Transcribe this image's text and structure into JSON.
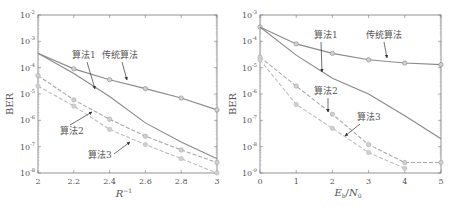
{
  "colors": {
    "axis": "#777777",
    "traditional": "#8a8a8a",
    "alg1": "#8a8a8a",
    "alg2": "#a8a8a8",
    "alg3": "#bdbdbd",
    "text": "#555555"
  },
  "chart_data": [
    {
      "type": "line",
      "title": "",
      "xlabel": "R^-1",
      "ylabel": "BER",
      "yscale": "log",
      "xlim": [
        2,
        3
      ],
      "ylim": [
        1e-08,
        0.01
      ],
      "grid": false,
      "xticks": [
        "2",
        "2.2",
        "2.4",
        "2.6",
        "2.8",
        "3"
      ],
      "yticks": [
        "10^-8",
        "10^-7",
        "10^-6",
        "10^-5",
        "10^-4",
        "10^-3",
        "10^-2"
      ],
      "x": [
        2,
        2.2,
        2.4,
        2.6,
        2.8,
        3
      ],
      "series": [
        {
          "name": "传统算法",
          "style": "solid",
          "marker": "circle",
          "values": [
            0.00035,
            9e-05,
            3.5e-05,
            1.6e-05,
            7e-06,
            2.5e-06
          ]
        },
        {
          "name": "算法1",
          "style": "solid",
          "marker": "none",
          "values": [
            0.00035,
            6e-05,
            8e-06,
            8e-07,
            1.5e-07,
            3.5e-08
          ]
        },
        {
          "name": "算法2",
          "style": "dashed",
          "marker": "circle",
          "values": [
            5e-05,
            6e-06,
            1.1e-06,
            2.5e-07,
            7.5e-08,
            2.5e-08
          ]
        },
        {
          "name": "算法3",
          "style": "dashed",
          "marker": "circle",
          "values": [
            2e-05,
            3.5e-06,
            4.5e-07,
            1.2e-07,
            3.5e-08,
            1e-08
          ]
        }
      ],
      "annotations": [
        {
          "text": "算法1",
          "x": 2.2,
          "y": 0.0004
        },
        {
          "text": "传统算法",
          "x": 2.36,
          "y": 0.0004
        },
        {
          "text": "算法2",
          "x": 2.12,
          "y": 4e-07
        },
        {
          "text": "算法3",
          "x": 2.3,
          "y": 6e-08
        }
      ]
    },
    {
      "type": "line",
      "title": "",
      "xlabel": "E_b/N_0",
      "ylabel": "BER",
      "yscale": "log",
      "xlim": [
        0,
        5
      ],
      "ylim": [
        1e-09,
        0.001
      ],
      "grid": false,
      "xticks": [
        "0",
        "1",
        "2",
        "3",
        "4",
        "5"
      ],
      "yticks": [
        "10^-9",
        "10^-8",
        "10^-7",
        "10^-6",
        "10^-5",
        "10^-4",
        "10^-3"
      ],
      "x": [
        0,
        1,
        2,
        3,
        4,
        5
      ],
      "series": [
        {
          "name": "传统算法",
          "style": "solid",
          "marker": "circle",
          "values": [
            0.00035,
            8e-05,
            3.5e-05,
            2e-05,
            1.5e-05,
            1.3e-05
          ]
        },
        {
          "name": "算法1",
          "style": "solid",
          "marker": "none",
          "values": [
            0.00035,
            3e-05,
            4e-06,
            1e-06,
            1.5e-07,
            2e-08
          ]
        },
        {
          "name": "算法2",
          "style": "dashed",
          "marker": "circle",
          "values": [
            2.5e-05,
            2e-06,
            1.7e-07,
            1.2e-08,
            2.5e-09,
            2.5e-09
          ]
        },
        {
          "name": "算法3",
          "style": "dashed",
          "marker": "circle",
          "values": [
            2e-05,
            4e-07,
            5e-08,
            6e-09,
            1.5e-09,
            null
          ]
        }
      ],
      "annotations": [
        {
          "text": "算法1",
          "x": 1.6,
          "y": 0.00015
        },
        {
          "text": "传统算法",
          "x": 3.1,
          "y": 0.00015
        },
        {
          "text": "算法2",
          "x": 1.5,
          "y": 1.2e-06
        },
        {
          "text": "算法3",
          "x": 2.7,
          "y": 1.5e-07
        }
      ]
    }
  ],
  "labels": {
    "left": {
      "ylabel": "BER",
      "xlabel_base": "R",
      "xlabel_sup": "−1",
      "ytick_base": "10",
      "yticks_exp": [
        "-8",
        "-7",
        "-6",
        "-5",
        "-4",
        "-3",
        "-2"
      ],
      "xticks": [
        "2",
        "2.2",
        "2.4",
        "2.6",
        "2.8",
        "3"
      ],
      "ann_alg1": "算法1",
      "ann_trad": "传统算法",
      "ann_alg2": "算法2",
      "ann_alg3": "算法3"
    },
    "right": {
      "ylabel": "BER",
      "xlabel_e": "E",
      "xlabel_b": "b",
      "xlabel_slash": "/",
      "xlabel_n": "N",
      "xlabel_0": "0",
      "ytick_base": "10",
      "yticks_exp": [
        "-9",
        "-8",
        "-7",
        "-6",
        "-5",
        "-4",
        "-3"
      ],
      "xticks": [
        "0",
        "1",
        "2",
        "3",
        "4",
        "5"
      ],
      "ann_alg1": "算法1",
      "ann_trad": "传统算法",
      "ann_alg2": "算法2",
      "ann_alg3": "算法3"
    }
  }
}
